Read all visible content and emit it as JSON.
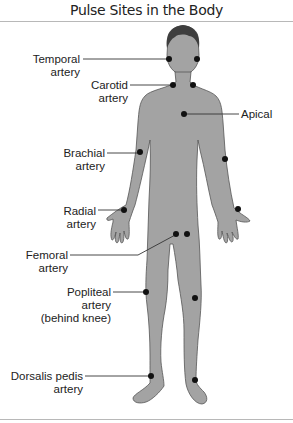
{
  "title": "Pulse Sites in the Body",
  "colors": {
    "body_fill": "#a3a3a3",
    "body_outline": "#555555",
    "hair": "#3e3e3e",
    "pulse_dot": "#111111",
    "leader_line": "#333333",
    "rule": "#b8b8b8"
  },
  "labels": {
    "temporal": {
      "line1": "Temporal",
      "line2": "artery"
    },
    "carotid": {
      "line1": "Carotid",
      "line2": "artery"
    },
    "apical": {
      "line1": "Apical"
    },
    "brachial": {
      "line1": "Brachial",
      "line2": "artery"
    },
    "radial": {
      "line1": "Radial",
      "line2": "artery"
    },
    "femoral": {
      "line1": "Femoral",
      "line2": "artery"
    },
    "popliteal": {
      "line1": "Popliteal",
      "line2": "artery",
      "line3": "(behind knee)"
    },
    "dorsalis_pedis": {
      "line1": "Dorsalis pedis",
      "line2": "artery"
    }
  }
}
